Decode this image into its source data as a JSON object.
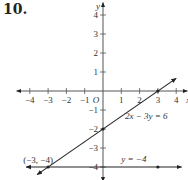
{
  "problem_number": "10.",
  "chart_data": {
    "type": "line",
    "title": "",
    "xlabel": "x",
    "ylabel": "y",
    "origin_label": "O",
    "xlim": [
      -4.5,
      4.5
    ],
    "ylim": [
      -4.5,
      4.5
    ],
    "x_ticks": [
      -4,
      -3,
      -2,
      -1,
      1,
      2,
      3,
      4
    ],
    "x_tick_labels": [
      "−4",
      "−3",
      "−2",
      "−1",
      "1",
      "2",
      "3",
      "4"
    ],
    "y_ticks": [
      4,
      3,
      2,
      1,
      -1,
      -2,
      -3,
      -4
    ],
    "y_tick_labels": [
      "4",
      "3",
      "2",
      "1",
      "−1",
      "−2",
      "−3",
      "−4"
    ],
    "grid": false,
    "series": [
      {
        "name": "2x − 3y = 6",
        "equation": "2x - 3y = 6",
        "slope": 0.6667,
        "intercept": -2,
        "x_range": [
          -3.6,
          4.0
        ],
        "label": "2x − 3y = 6"
      },
      {
        "name": "y = −4",
        "equation": "y = -4",
        "slope": 0,
        "intercept": -4,
        "x_range": [
          -4.2,
          4.3
        ],
        "label": "y = −4"
      }
    ],
    "points": [
      {
        "x": 3,
        "y": 0,
        "label": ""
      },
      {
        "x": 0,
        "y": -2,
        "label": ""
      },
      {
        "x": 3,
        "y": -4,
        "label": ""
      },
      {
        "x": -3,
        "y": -4,
        "label": "(−3, −4)"
      }
    ]
  }
}
